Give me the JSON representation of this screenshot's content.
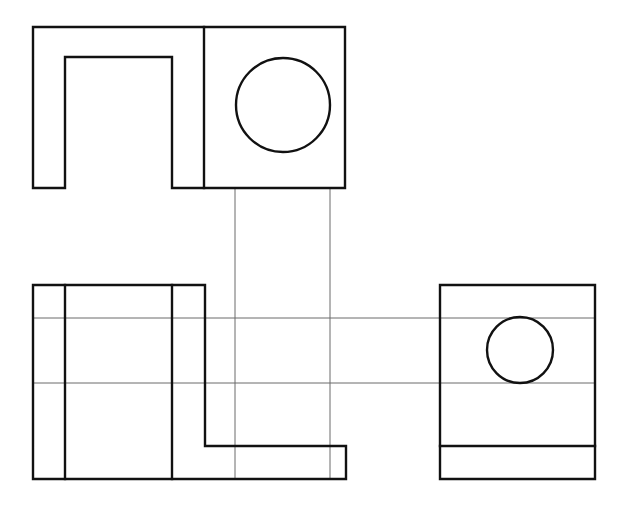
{
  "sheet": {
    "title": "Orthographic Projection Drawing",
    "width": 629,
    "height": 509,
    "background_color": "#ffffff",
    "line_color": "#111111",
    "projection_line_color": "#6b6b6b",
    "outline_stroke_width": 2.4,
    "projection_stroke_width": 1
  },
  "views": {
    "top_view": {
      "name": "top-view",
      "label": "Top view (plan) with through hole",
      "outline_points": "33,27 345,27 345,188 172,188 172,57 65,57 65,188 33,188 33,27",
      "divider_line": {
        "x1": 204,
        "y1": 27,
        "x2": 204,
        "y2": 188
      },
      "hole": {
        "cx": 283,
        "cy": 105,
        "r": 47
      }
    },
    "front_view": {
      "name": "front-view",
      "label": "Front view (elevation) with stepped profile",
      "outline_points": "33,285 205,285 205,446 346,446 346,479 33,479 33,285",
      "internal_lines": [
        {
          "name": "front-edge-line-1",
          "x1": 65,
          "y1": 285,
          "x2": 65,
          "y2": 479
        },
        {
          "name": "front-edge-line-2",
          "x1": 172,
          "y1": 285,
          "x2": 172,
          "y2": 479
        }
      ]
    },
    "right_view": {
      "name": "right-side-view",
      "label": "Right side view with counterbore hole",
      "outline_points": "440,285 595,285 595,479 440,479 440,285",
      "internal_lines": [
        {
          "name": "right-base-line",
          "x1": 440,
          "y1": 446,
          "x2": 595,
          "y2": 446
        }
      ],
      "hole": {
        "cx": 520,
        "cy": 350,
        "r": 33
      }
    }
  },
  "projection_lines": {
    "vertical": [
      {
        "name": "vertical-projection-left",
        "x1": 235,
        "y1": 188,
        "x2": 235,
        "y2": 479
      },
      {
        "name": "vertical-projection-right",
        "x1": 330,
        "y1": 188,
        "x2": 330,
        "y2": 479
      }
    ],
    "horizontal": [
      {
        "name": "horizontal-projection-upper",
        "x1": 33,
        "y1": 318,
        "x2": 595,
        "y2": 318
      },
      {
        "name": "horizontal-projection-lower",
        "x1": 33,
        "y1": 383,
        "x2": 595,
        "y2": 383
      }
    ]
  }
}
